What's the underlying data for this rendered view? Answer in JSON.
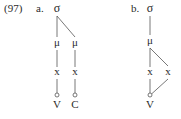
{
  "example_number": "(97)",
  "diagrams": [
    {
      "label": "a.",
      "root": "σ",
      "moras": [
        "μ",
        "μ"
      ],
      "timing_slots": [
        "x",
        "x"
      ],
      "segments": [
        "V",
        "C"
      ]
    },
    {
      "label": "b.",
      "root": "σ",
      "moras": [
        "μ"
      ],
      "timing_slots": [
        "x",
        "x"
      ],
      "segments": [
        "V"
      ]
    }
  ]
}
